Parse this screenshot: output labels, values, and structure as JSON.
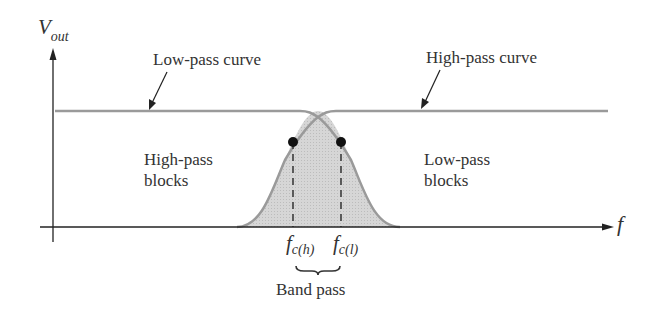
{
  "diagram": {
    "y_axis_label": "V",
    "y_axis_sub": "out",
    "x_axis_label": "f",
    "low_pass_curve_label": "Low-pass curve",
    "high_pass_curve_label": "High-pass curve",
    "high_pass_blocks_line1": "High-pass",
    "high_pass_blocks_line2": "blocks",
    "low_pass_blocks_line1": "Low-pass",
    "low_pass_blocks_line2": "blocks",
    "fch_main": "f",
    "fch_sub": "c(h)",
    "fcl_main": "f",
    "fcl_sub": "c(l)",
    "band_pass_label": "Band pass",
    "colors": {
      "curve": "#9a9a9a",
      "fill": "#d4d4d4",
      "axis": "#222222",
      "dot": "#111111"
    }
  }
}
